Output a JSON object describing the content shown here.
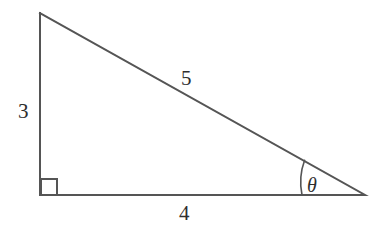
{
  "figure": {
    "kind": "right-triangle-diagram",
    "background_color": "#ffffff",
    "stroke_color": "#555555",
    "text_color": "#2e2e2e",
    "stroke_width": 2,
    "width": 382,
    "height": 236
  },
  "geometry": {
    "vertices": {
      "apex_top_left": {
        "x": 40,
        "y": 13
      },
      "right_angle_bottom_left": {
        "x": 40,
        "y": 195
      },
      "acute_bottom_right": {
        "x": 365,
        "y": 195
      }
    },
    "right_angle_marker": {
      "x": 41,
      "y": 179,
      "size": 16
    },
    "angle_arc": {
      "center_x": 365,
      "center_y": 195,
      "radius": 63,
      "start_x": 302,
      "start_y": 195,
      "end_x": 304.6,
      "end_y": 160.3
    }
  },
  "labels": {
    "leg_vertical": "3",
    "hypotenuse": "5",
    "leg_horizontal": "4",
    "angle": "θ"
  },
  "chart_data": {
    "type": "diagram",
    "title": "",
    "shape": "right triangle",
    "side_lengths": {
      "opposite": 3,
      "adjacent": 4,
      "hypotenuse": 5
    },
    "categories": [
      "vertical leg",
      "horizontal leg",
      "hypotenuse"
    ],
    "values": [
      3,
      4,
      5
    ],
    "angles": {
      "theta_symbol": "θ",
      "theta_location": "bottom-right vertex",
      "right_angle_location": "bottom-left vertex",
      "right_angle_degrees": 90
    },
    "annotations": [
      "3",
      "4",
      "5",
      "θ",
      "right angle square"
    ]
  }
}
